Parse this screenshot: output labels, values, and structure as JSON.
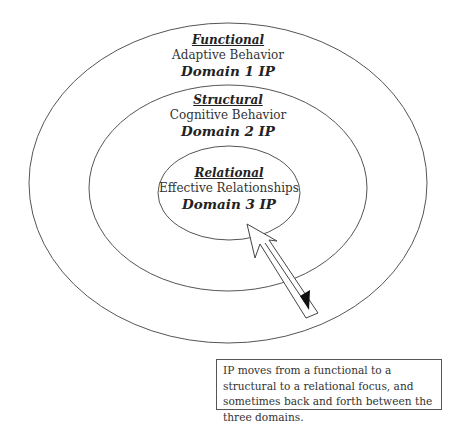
{
  "diagram": {
    "domains": [
      {
        "title": "Functional",
        "description": "Adaptive Behavior",
        "domain_label": "Domain 1 IP",
        "ring": "outer"
      },
      {
        "title": "Structural",
        "description": "Cognitive Behavior",
        "domain_label": "Domain 2 IP",
        "ring": "middle"
      },
      {
        "title": "Relational",
        "description": "Effective Relationships",
        "domain_label": "Domain 3 IP",
        "ring": "inner"
      }
    ],
    "arrow": {
      "type": "double-headed",
      "direction": "toward center and back"
    },
    "note": "IP moves from a functional to a structural to a relational focus, and sometimes back and forth between the three domains.",
    "colors": {
      "stroke": "#444444",
      "background": "#ffffff",
      "text": "#222222"
    }
  }
}
